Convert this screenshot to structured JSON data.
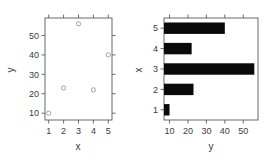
{
  "figure": {
    "background_color": "#ffffff",
    "axis_color": "#5a5a5a",
    "bar_color": "#0a0a0a",
    "point_color": "#8c8c8c"
  },
  "chart_data": [
    {
      "type": "scatter",
      "panel": "left",
      "title": "",
      "xlabel": "x",
      "ylabel": "y",
      "x": [
        1,
        2,
        3,
        4,
        5
      ],
      "values": [
        10,
        23,
        56,
        22,
        40
      ],
      "xticks": [
        "1",
        "2",
        "3",
        "4",
        "5"
      ],
      "xtick_values": [
        1,
        2,
        3,
        4,
        5
      ],
      "yticks": [
        "10",
        "20",
        "30",
        "40",
        "50"
      ],
      "ytick_values": [
        10,
        20,
        30,
        40,
        50
      ],
      "xlim": [
        0.75,
        5.25
      ],
      "ylim": [
        6.5,
        59
      ],
      "grid": false,
      "legend": false,
      "marker": "open-circle",
      "box_frame": true,
      "ticks_all_sides": true
    },
    {
      "type": "bar",
      "panel": "right",
      "orientation": "horizontal",
      "title": "",
      "xlabel": "y",
      "ylabel": "x",
      "categories": [
        "1",
        "2",
        "3",
        "4",
        "5"
      ],
      "values": [
        10,
        23,
        56,
        22,
        40
      ],
      "xticks": [
        "10",
        "20",
        "30",
        "40",
        "50"
      ],
      "xtick_values": [
        10,
        20,
        30,
        40,
        50
      ],
      "yticks": [
        "1",
        "2",
        "3",
        "4",
        "5"
      ],
      "xlim": [
        7,
        58
      ],
      "grid": false,
      "legend": false,
      "bar_fill": "#0a0a0a"
    }
  ],
  "labels": {
    "left_axis_x_title": "x",
    "left_axis_y_title": "y",
    "right_axis_x_title": "y",
    "right_axis_y_title": "x"
  }
}
